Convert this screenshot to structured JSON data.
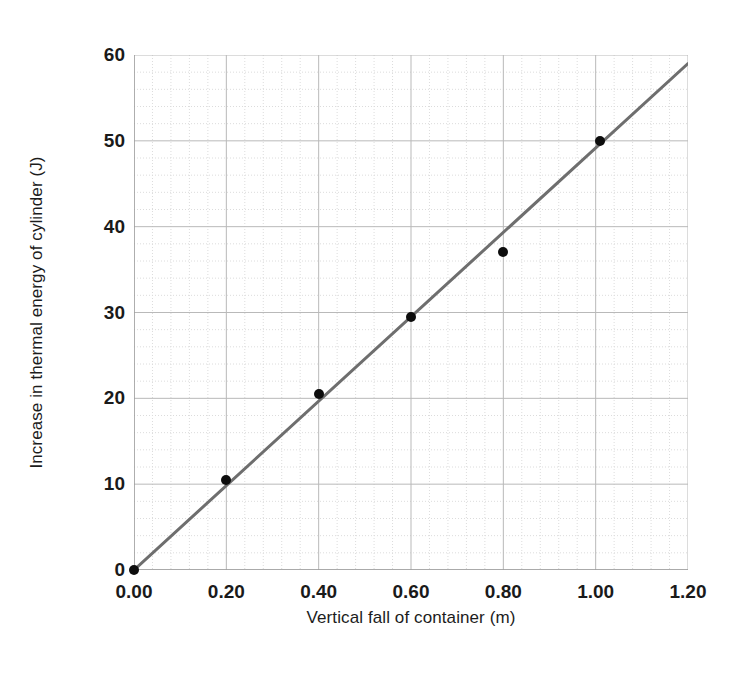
{
  "chart_data": {
    "type": "scatter",
    "title": "",
    "xlabel": "Vertical fall of container (m)",
    "ylabel": "Increase in thermal energy of cylinder (J)",
    "xlim": [
      0.0,
      1.2
    ],
    "ylim": [
      0,
      60
    ],
    "xticks": [
      "0.00",
      "0.20",
      "0.40",
      "0.60",
      "0.80",
      "1.00",
      "1.20"
    ],
    "xtick_values": [
      0.0,
      0.2,
      0.4,
      0.6,
      0.8,
      1.0,
      1.2
    ],
    "yticks": [
      "0",
      "10",
      "20",
      "30",
      "40",
      "50",
      "60"
    ],
    "ytick_values": [
      0,
      10,
      20,
      30,
      40,
      50,
      60
    ],
    "grid": "major-and-minor",
    "grid_major_x_step": 0.2,
    "grid_minor_x_step": 0.04,
    "grid_major_y_step": 10,
    "grid_minor_y_step": 2,
    "legend": "none",
    "x": [
      0.0,
      0.2,
      0.4,
      0.6,
      0.8,
      1.01
    ],
    "y": [
      0.0,
      10.5,
      20.5,
      29.5,
      37.0,
      50.0
    ],
    "points": [
      {
        "x": 0.0,
        "y": 0.0
      },
      {
        "x": 0.2,
        "y": 10.5
      },
      {
        "x": 0.4,
        "y": 20.5
      },
      {
        "x": 0.6,
        "y": 29.5
      },
      {
        "x": 0.8,
        "y": 37.0
      },
      {
        "x": 1.01,
        "y": 50.0
      }
    ],
    "series": [
      {
        "name": "Increase in thermal energy",
        "marker": "filled-circle",
        "marker_color": "#0d0d0d",
        "values": [
          0.0,
          10.5,
          20.5,
          29.5,
          37.0,
          50.0
        ]
      }
    ],
    "trendline": {
      "type": "line-of-best-fit",
      "x_start": 0.0,
      "y_start": 0.0,
      "x_end": 1.2,
      "y_end": 59.0,
      "color": "#6e6e6e",
      "width_px": 3
    },
    "colors": {
      "marker": "#0d0d0d",
      "trendline": "#6e6e6e",
      "grid_major": "#b9b9b9",
      "grid_minor": "#dcdcdc",
      "axis": "#9a9a9a",
      "text": "#1a1a1a",
      "background": "#ffffff"
    }
  }
}
